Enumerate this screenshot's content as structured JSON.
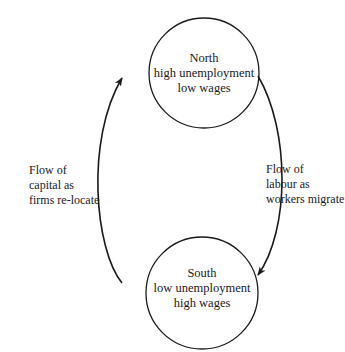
{
  "diagram": {
    "nodes": [
      {
        "id": "north",
        "title": "North",
        "line1": "high unemployment",
        "line2": "low wages"
      },
      {
        "id": "south",
        "title": "South",
        "line1": "low unemployment",
        "line2": "high wages"
      }
    ],
    "flows": [
      {
        "id": "capital",
        "from": "south",
        "to": "north",
        "line1": "Flow of",
        "line2": "capital as",
        "line3": "firms re-locate"
      },
      {
        "id": "labour",
        "from": "north",
        "to": "south",
        "line1": "Flow of",
        "line2": "labour as",
        "line3": "workers migrate"
      }
    ],
    "colors": {
      "stroke": "#1a1a1a",
      "background": "#ffffff"
    }
  }
}
